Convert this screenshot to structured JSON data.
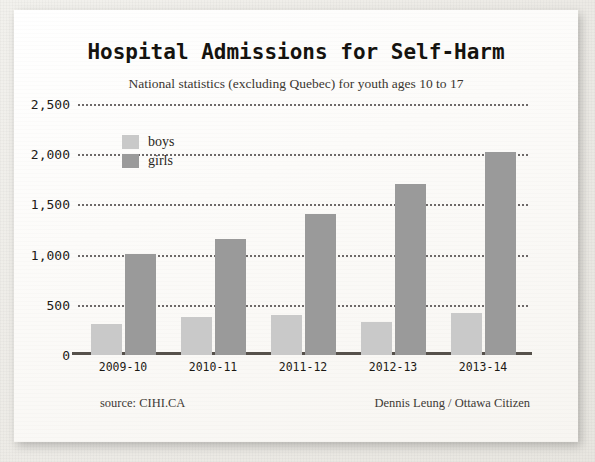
{
  "chart_data": {
    "type": "bar",
    "title": "Hospital Admissions for Self-Harm",
    "subtitle": "National statistics (excluding Quebec) for youth ages 10 to 17",
    "xlabel": "",
    "ylabel": "",
    "ylim": [
      0,
      2500
    ],
    "ytick_labels": [
      "2,500",
      "2,000",
      "1,500",
      "1,000",
      "500",
      "0"
    ],
    "ytick_values": [
      2500,
      2000,
      1500,
      1000,
      500,
      0
    ],
    "grid": true,
    "grid_style": "dotted horizontal",
    "legend_position": "upper-left inside plot",
    "categories": [
      "2009-10",
      "2010-11",
      "2011-12",
      "2012-13",
      "2013-14"
    ],
    "series": [
      {
        "name": "boys",
        "color": "#c9c9c9",
        "values": [
          310,
          380,
          395,
          330,
          420
        ]
      },
      {
        "name": "girls",
        "color": "#9a9a9a",
        "values": [
          1010,
          1160,
          1400,
          1700,
          2020
        ]
      }
    ],
    "source": "source: CIHI.CA",
    "credit": "Dennis Leung / Ottawa Citizen"
  },
  "colors": {
    "boys": "#c9c9c9",
    "girls": "#9a9a9a",
    "axis": "#56514b",
    "grid": "#555050",
    "card_background": "#fbfaf8",
    "page_background": "#efeeea",
    "text": "#1d1a16"
  }
}
